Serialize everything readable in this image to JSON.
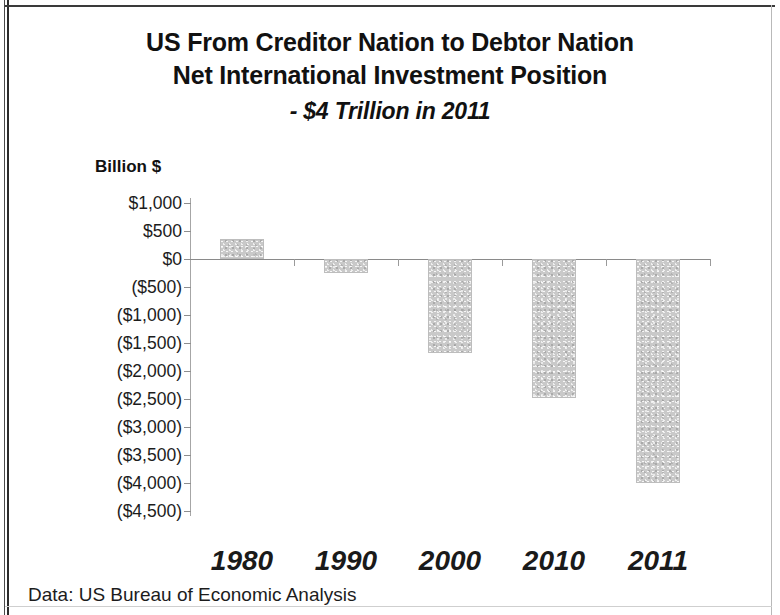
{
  "slide": {
    "title_lines": [
      "US From Creditor Nation to Debtor Nation",
      "Net International Investment Position"
    ],
    "subtitle": "- $4 Trillion in 2011",
    "source_note": "Data: US Bureau of Economic Analysis"
  },
  "chart_data": {
    "type": "bar",
    "title": "US From Creditor Nation to Debtor Nation Net International Investment Position - $4 Trillion in 2011",
    "xlabel": "",
    "ylabel": "Billion $",
    "categories": [
      "1980",
      "1990",
      "2000",
      "2010",
      "2011"
    ],
    "values": [
      360,
      -250,
      -1670,
      -2480,
      -4000
    ],
    "ylim": [
      -4500,
      1000
    ],
    "ytick_values": [
      1000,
      500,
      0,
      -500,
      -1000,
      -1500,
      -2000,
      -2500,
      -3000,
      -3500,
      -4000,
      -4500
    ],
    "ytick_labels": [
      "$1,000",
      "$500",
      "$0",
      "($500)",
      "($1,000)",
      "($1,500)",
      "($2,000)",
      "($2,500)",
      "($3,000)",
      "($3,500)",
      "($4,000)",
      "($4,500)"
    ],
    "grid": false,
    "legend": false,
    "bar_color": "#c9c9c9",
    "axis_color": "#8a8a8a"
  }
}
